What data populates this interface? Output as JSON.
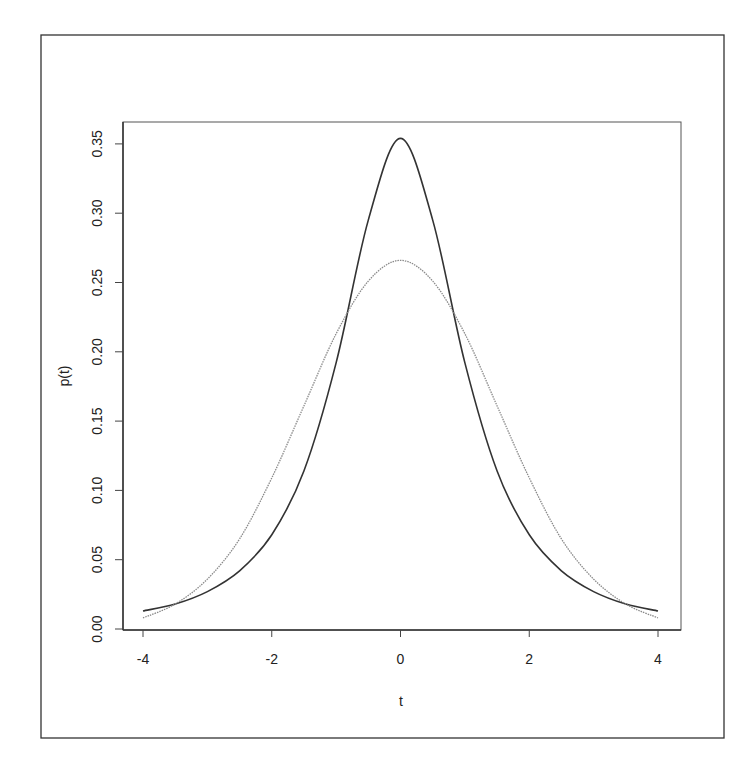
{
  "chart_data": {
    "type": "line",
    "title": "",
    "xlabel": "t",
    "ylabel": "p(t)",
    "xlim": [
      -4,
      4
    ],
    "ylim": [
      0,
      0.36
    ],
    "xticks": [
      -4,
      -2,
      0,
      2,
      4
    ],
    "xtick_labels": [
      "-4",
      "-2",
      "0",
      "2",
      "4"
    ],
    "yticks": [
      0.0,
      0.05,
      0.1,
      0.15,
      0.2,
      0.25,
      0.3,
      0.35
    ],
    "ytick_labels": [
      "0.00",
      "0.05",
      "0.10",
      "0.15",
      "0.20",
      "0.25",
      "0.30",
      "0.35"
    ],
    "grid": false,
    "legend": null,
    "x": [
      -4,
      -3.5,
      -3,
      -2.5,
      -2,
      -1.5,
      -1,
      -0.5,
      0,
      0.5,
      1,
      1.5,
      2,
      2.5,
      3,
      3.5,
      4
    ],
    "series": [
      {
        "name": "heavy-tailed density (peaked, dark solid)",
        "color": "#333333",
        "style": "solid",
        "values": [
          0.013,
          0.018,
          0.027,
          0.042,
          0.068,
          0.114,
          0.192,
          0.295,
          0.354,
          0.295,
          0.192,
          0.114,
          0.068,
          0.042,
          0.027,
          0.018,
          0.013
        ]
      },
      {
        "name": "normal density (flatter, gray dotted)",
        "color": "#8a8a8a",
        "style": "dotted",
        "values": [
          0.008,
          0.018,
          0.036,
          0.065,
          0.109,
          0.161,
          0.213,
          0.251,
          0.266,
          0.251,
          0.213,
          0.161,
          0.109,
          0.065,
          0.036,
          0.018,
          0.008
        ]
      }
    ]
  },
  "axes": {
    "xlabel": "t",
    "ylabel": "p(t)",
    "xtick_labels": [
      "-4",
      "-2",
      "0",
      "2",
      "4"
    ],
    "ytick_labels": [
      "0.00",
      "0.05",
      "0.10",
      "0.15",
      "0.20",
      "0.25",
      "0.30",
      "0.35"
    ]
  }
}
